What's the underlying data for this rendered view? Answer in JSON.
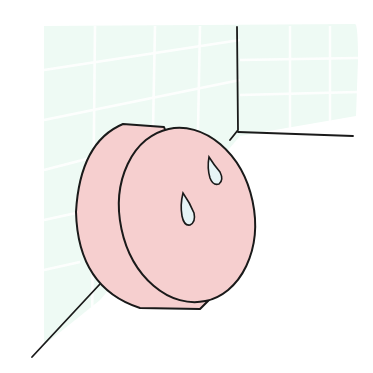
{
  "illustration": {
    "subject": "pink soap bar with water droplets against tiled wall corner",
    "colors": {
      "background": "#ffffff",
      "tile": "#eefaf4",
      "tile_grout": "#ffffff",
      "soap": "#f6cfcf",
      "outline": "#1a1a1a",
      "droplet": "#e6f4f6"
    }
  }
}
